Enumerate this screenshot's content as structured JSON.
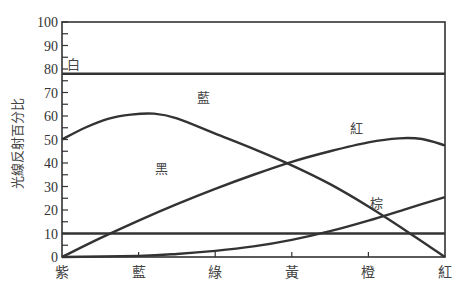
{
  "chart_data": {
    "type": "line",
    "title": "",
    "xlabel": "",
    "ylabel": "光線反射百分比",
    "ylim": [
      0,
      100
    ],
    "yticks": [
      0,
      10,
      20,
      30,
      40,
      50,
      60,
      70,
      80,
      90,
      100
    ],
    "categories": [
      "紫",
      "藍",
      "綠",
      "黃",
      "橙",
      "紅"
    ],
    "grid": false,
    "legend": "inline labels",
    "series": [
      {
        "name": "白",
        "color": "#333333",
        "points": [
          [
            0,
            78
          ],
          [
            5,
            78
          ]
        ],
        "label_pos": [
          0.15,
          82
        ]
      },
      {
        "name": "藍",
        "color": "#333333",
        "points": [
          [
            0,
            50
          ],
          [
            0.3,
            55
          ],
          [
            0.6,
            58.8
          ],
          [
            0.9,
            60.6
          ],
          [
            1.2,
            61
          ],
          [
            1.5,
            59
          ],
          [
            2.0,
            52.5
          ],
          [
            2.5,
            46
          ],
          [
            3.0,
            39
          ],
          [
            3.5,
            31
          ],
          [
            4.0,
            21.5
          ],
          [
            4.5,
            11
          ],
          [
            5.0,
            0
          ]
        ],
        "label_pos": [
          1.85,
          68
        ]
      },
      {
        "name": "紅",
        "color": "#333333",
        "points": [
          [
            0,
            0
          ],
          [
            0.5,
            8
          ],
          [
            1.0,
            15.5
          ],
          [
            1.5,
            22.5
          ],
          [
            2.0,
            29
          ],
          [
            2.5,
            35
          ],
          [
            3.0,
            40.5
          ],
          [
            3.5,
            45
          ],
          [
            4.0,
            48.8
          ],
          [
            4.4,
            50.5
          ],
          [
            4.7,
            50.2
          ],
          [
            5.0,
            47.5
          ]
        ],
        "label_pos": [
          3.85,
          55
        ]
      },
      {
        "name": "黑",
        "color": "#333333",
        "points": [
          [
            0,
            10
          ],
          [
            5,
            10
          ]
        ],
        "label_pos": [
          1.3,
          38
        ]
      },
      {
        "name": "棕",
        "color": "#333333",
        "points": [
          [
            0,
            0
          ],
          [
            1.0,
            0.5
          ],
          [
            1.5,
            1.3
          ],
          [
            2.0,
            2.6
          ],
          [
            2.5,
            4.5
          ],
          [
            3.0,
            7.3
          ],
          [
            3.5,
            11
          ],
          [
            4.0,
            15.5
          ],
          [
            4.5,
            20.5
          ],
          [
            5.0,
            25.5
          ]
        ],
        "label_pos": [
          4.1,
          23
        ]
      }
    ]
  }
}
